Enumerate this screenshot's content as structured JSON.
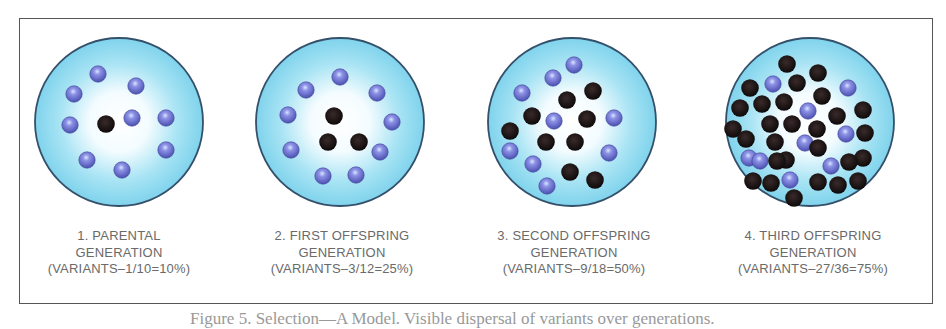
{
  "colors": {
    "dish_fill_edge": "#7fd6ee",
    "dish_fill_center": "#ffffff",
    "dish_outline": "#35506a",
    "original_dot": "#6d6fd0",
    "variant_dot": "#1a1313",
    "frame": "#555555",
    "label_text": "#6a6a6a"
  },
  "legend": {
    "blue_dot": "original organism",
    "black_dot": "variant organism"
  },
  "panels": [
    {
      "title": "1. PARENTAL",
      "subtitle": "GENERATION",
      "ratio": "(VARIANTS–1/10=10%)",
      "variants": 1,
      "total": 10,
      "percent": 10,
      "blue": [
        [
          98,
          74
        ],
        [
          74,
          94
        ],
        [
          136,
          86
        ],
        [
          70,
          125
        ],
        [
          132,
          118
        ],
        [
          166,
          118
        ],
        [
          166,
          150
        ],
        [
          87,
          160
        ],
        [
          122,
          170
        ]
      ],
      "black": [
        [
          106,
          124
        ]
      ]
    },
    {
      "title": "2. FIRST OFFSPRING",
      "subtitle": "GENERATION",
      "ratio": "(VARIANTS–3/12=25%)",
      "variants": 3,
      "total": 12,
      "percent": 25,
      "blue": [
        [
          340,
          77
        ],
        [
          306,
          90
        ],
        [
          377,
          93
        ],
        [
          288,
          115
        ],
        [
          392,
          122
        ],
        [
          291,
          150
        ],
        [
          380,
          152
        ],
        [
          323,
          176
        ],
        [
          356,
          175
        ]
      ],
      "black": [
        [
          334,
          116
        ],
        [
          328,
          142
        ],
        [
          359,
          142
        ]
      ]
    },
    {
      "title": "3. SECOND OFFSPRING",
      "subtitle": "GENERATION",
      "ratio": "(VARIANTS–9/18=50%)",
      "variants": 9,
      "total": 18,
      "percent": 50,
      "blue": [
        [
          574,
          65
        ],
        [
          553,
          78
        ],
        [
          522,
          93
        ],
        [
          554,
          121
        ],
        [
          614,
          118
        ],
        [
          510,
          151
        ],
        [
          533,
          164
        ],
        [
          547,
          186
        ],
        [
          609,
          153
        ]
      ],
      "black": [
        [
          567,
          100
        ],
        [
          593,
          91
        ],
        [
          532,
          116
        ],
        [
          587,
          119
        ],
        [
          510,
          131
        ],
        [
          546,
          142
        ],
        [
          575,
          142
        ],
        [
          570,
          172
        ],
        [
          595,
          180
        ]
      ]
    },
    {
      "title": "4. THIRD OFFSPRING",
      "subtitle": "GENERATION",
      "ratio": "(VARIANTS–27/36=75%)",
      "variants": 27,
      "total": 36,
      "percent": 75,
      "blue": [
        [
          773,
          84
        ],
        [
          848,
          88
        ],
        [
          808,
          111
        ],
        [
          846,
          134
        ],
        [
          805,
          143
        ],
        [
          749,
          158
        ],
        [
          831,
          166
        ],
        [
          790,
          180
        ],
        [
          760,
          161
        ]
      ],
      "black": [
        [
          787,
          64
        ],
        [
          818,
          73
        ],
        [
          750,
          88
        ],
        [
          797,
          83
        ],
        [
          822,
          96
        ],
        [
          740,
          108
        ],
        [
          762,
          104
        ],
        [
          784,
          102
        ],
        [
          837,
          116
        ],
        [
          863,
          110
        ],
        [
          733,
          129
        ],
        [
          770,
          124
        ],
        [
          792,
          124
        ],
        [
          817,
          129
        ],
        [
          746,
          139
        ],
        [
          775,
          142
        ],
        [
          818,
          148
        ],
        [
          865,
          133
        ],
        [
          786,
          160
        ],
        [
          863,
          158
        ],
        [
          777,
          161
        ],
        [
          849,
          162
        ],
        [
          753,
          181
        ],
        [
          771,
          183
        ],
        [
          818,
          182
        ],
        [
          838,
          185
        ],
        [
          858,
          181
        ],
        [
          794,
          198
        ]
      ]
    }
  ],
  "caption": "Figure 5. Selection—A Model. Visible dispersal of variants over generations."
}
